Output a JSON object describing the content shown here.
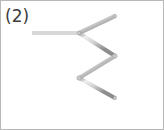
{
  "figure": {
    "label": "(2)",
    "type": "matchstick-puzzle-figure",
    "background_color": "#ffffff",
    "border_color": "#b8b8b8",
    "label_color": "#3b3b3b"
  },
  "matchstick": {
    "outline_color": "#8f8f8f",
    "fill_color": "#d8d8d8",
    "highlight_color": "#f2f2f2",
    "thickness": 4
  },
  "shapes": {
    "squares": [
      {
        "name": "left-upper-square",
        "x": 31,
        "y": 32,
        "w": 47,
        "h": 45
      },
      {
        "name": "left-lower-square",
        "x": 31,
        "y": 77,
        "w": 47,
        "h": 43
      },
      {
        "name": "right-upper-square",
        "x": 114,
        "y": 15,
        "w": 43,
        "h": 40
      },
      {
        "name": "right-lower-square",
        "x": 114,
        "y": 57,
        "w": 43,
        "h": 40
      }
    ],
    "triangles": [
      {
        "name": "upper-triangle",
        "points": [
          [
            78,
            32
          ],
          [
            114,
            15
          ],
          [
            114,
            55
          ]
        ]
      },
      {
        "name": "lower-triangle",
        "points": [
          [
            78,
            77
          ],
          [
            114,
            55
          ],
          [
            114,
            97
          ]
        ]
      }
    ]
  },
  "counts": {
    "squares": 4,
    "triangles": 2
  }
}
